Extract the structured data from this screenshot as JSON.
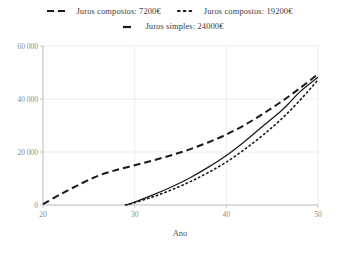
{
  "legend": {
    "rows": [
      [
        {
          "label": "Juros compostos: 7200€",
          "style": "dashed",
          "color": "#1a1a1a"
        },
        {
          "label": "Juros compostos: 19200€",
          "style": "dotted",
          "color": "#1a1a1a"
        }
      ],
      [
        {
          "label": "Juros simples: 24000€",
          "style": "solid",
          "color": "#1a1a1a"
        }
      ]
    ]
  },
  "chart_data": {
    "type": "line",
    "title": "",
    "xlabel": "Ano",
    "ylabel": "",
    "xlim": [
      20,
      50
    ],
    "ylim": [
      0,
      60000
    ],
    "xticks": [
      20,
      30,
      40,
      50
    ],
    "xtick_labels": [
      "20",
      "30",
      "40",
      "50"
    ],
    "yticks": [
      0,
      20000,
      40000,
      60000
    ],
    "ytick_labels": [
      "0",
      "20 000",
      "40 000",
      "60 000"
    ],
    "grid": true,
    "legend_position": "top",
    "series": [
      {
        "name": "Juros compostos: 7200€",
        "style": "dashed",
        "color": "#1a1a1a",
        "x": [
          20,
          22,
          24,
          26,
          28,
          30,
          32,
          34,
          36,
          38,
          40,
          42,
          44,
          46,
          48,
          50
        ],
        "y": [
          300,
          4200,
          7800,
          11000,
          13200,
          15000,
          16800,
          18800,
          21000,
          23600,
          26600,
          30200,
          34400,
          39000,
          44000,
          49400
        ]
      },
      {
        "name": "Juros compostos: 19200€",
        "style": "dotted",
        "color": "#1a1a1a",
        "x": [
          29,
          30,
          32,
          34,
          36,
          38,
          40,
          42,
          44,
          46,
          48,
          50
        ],
        "y": [
          0,
          900,
          3100,
          5700,
          8700,
          12200,
          16200,
          21000,
          26400,
          32400,
          39400,
          47200
        ]
      },
      {
        "name": "Juros simples: 24000€",
        "style": "solid",
        "color": "#1a1a1a",
        "x": [
          29,
          30,
          32,
          34,
          36,
          38,
          40,
          42,
          44,
          46,
          47,
          48,
          50
        ],
        "y": [
          0,
          1100,
          3800,
          6800,
          10200,
          14200,
          18700,
          24000,
          29800,
          35600,
          39000,
          42600,
          48200
        ]
      }
    ]
  }
}
